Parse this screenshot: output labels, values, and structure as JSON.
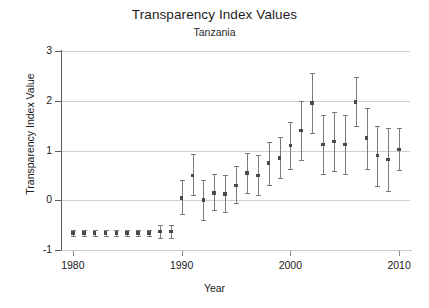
{
  "chart_data": {
    "type": "scatter",
    "title": "Transparency Index Values",
    "subtitle": "Tanzania",
    "xlabel": "Year",
    "ylabel": "Transparency Index Value",
    "grid": true,
    "legend": "none",
    "xlim": [
      1979,
      2011
    ],
    "ylim": [
      -1,
      3
    ],
    "yticks": [
      -1,
      0,
      1,
      2,
      3
    ],
    "ytick_labels": [
      "-1",
      "0",
      "1",
      "2",
      "3"
    ],
    "xticks": [
      1980,
      1990,
      2000,
      2010
    ],
    "xtick_labels": [
      "1980",
      "1990",
      "2000",
      "2010"
    ],
    "series_name": "Transparency Index Value",
    "marker_color": "#4a4a4a",
    "errorbar_color": "#7a7a7a",
    "gridline_color": "#cfcfcf",
    "x": [
      1980,
      1981,
      1982,
      1983,
      1984,
      1985,
      1986,
      1987,
      1988,
      1989,
      1990,
      1991,
      1992,
      1993,
      1994,
      1995,
      1996,
      1997,
      1998,
      1999,
      2000,
      2001,
      2002,
      2003,
      2004,
      2005,
      2006,
      2007,
      2008,
      2009,
      2010
    ],
    "values": [
      -0.66,
      -0.66,
      -0.66,
      -0.66,
      -0.66,
      -0.66,
      -0.66,
      -0.66,
      -0.63,
      -0.63,
      0.05,
      0.5,
      0.0,
      0.15,
      0.12,
      0.3,
      0.55,
      0.5,
      0.75,
      0.85,
      1.1,
      1.4,
      1.95,
      1.12,
      1.18,
      1.12,
      1.98,
      1.25,
      0.9,
      0.82,
      1.02
    ],
    "err_low": [
      -0.72,
      -0.72,
      -0.72,
      -0.72,
      -0.72,
      -0.72,
      -0.72,
      -0.72,
      -0.76,
      -0.76,
      -0.28,
      0.1,
      -0.4,
      -0.2,
      -0.24,
      -0.05,
      0.15,
      0.1,
      0.3,
      0.45,
      0.62,
      0.8,
      1.35,
      0.52,
      0.58,
      0.52,
      1.5,
      0.62,
      0.28,
      0.18,
      0.6
    ],
    "err_high": [
      -0.6,
      -0.6,
      -0.6,
      -0.6,
      -0.6,
      -0.6,
      -0.6,
      -0.6,
      -0.5,
      -0.5,
      0.4,
      0.92,
      0.4,
      0.52,
      0.5,
      0.68,
      0.95,
      0.9,
      1.18,
      1.28,
      1.58,
      2.0,
      2.55,
      1.72,
      1.78,
      1.72,
      2.48,
      1.85,
      1.5,
      1.45,
      1.45
    ]
  }
}
